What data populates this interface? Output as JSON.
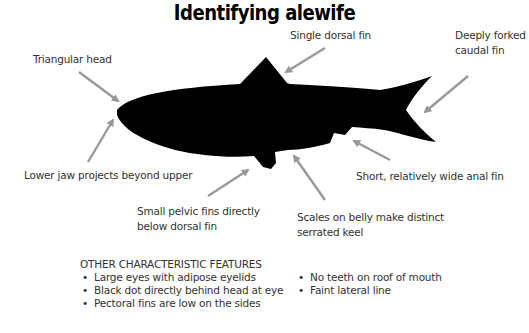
{
  "title": "Identifying alewife",
  "labels": {
    "triangular_head": "Triangular head",
    "single_dorsal": "Single dorsal fin",
    "caudal_line1": "Deeply forked",
    "caudal_line2": "caudal fin",
    "lower_jaw": "Lower jaw projects beyond upper",
    "anal_fin": "Short, relatively wide anal fin",
    "pelvic_line1": "Small pelvic fins directly",
    "pelvic_line2": "below dorsal fin",
    "scales_line1": "Scales on belly make distinct",
    "scales_line2": "serrated keel"
  },
  "features": {
    "heading": "OTHER CHARACTERISTIC FEATURES",
    "left": [
      "Large eyes with adipose eyelids",
      "Black dot directly behind head at eye",
      "Pectoral fins are low on the sides"
    ],
    "right": [
      "No teeth on roof of mouth",
      "Faint lateral line"
    ]
  },
  "colors": {
    "fish": "#000000",
    "arrow": "#999999",
    "text": "#333333"
  }
}
